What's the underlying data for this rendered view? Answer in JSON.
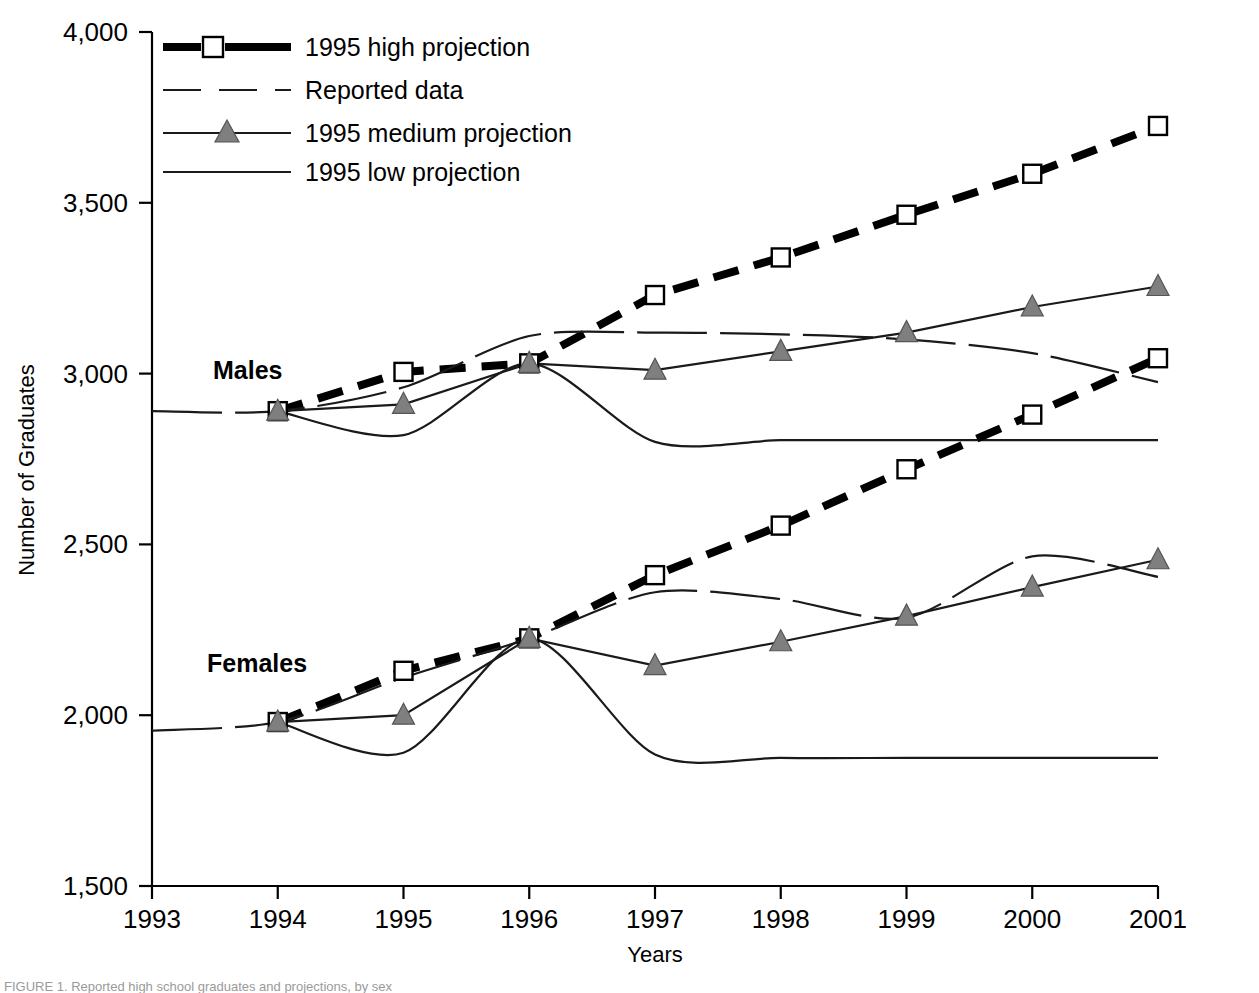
{
  "figure": {
    "caption_fragment": "FIGURE 1. Reported high school graduates and projections, by sex"
  },
  "axes": {
    "y_title": "Number of Graduates",
    "x_title": "Years",
    "y_ticks": [
      "4,000",
      "3,500",
      "3,000",
      "2,500",
      "2,000",
      "1,500"
    ],
    "x_ticks": [
      "1993",
      "1994",
      "1995",
      "1996",
      "1997",
      "1998",
      "1999",
      "2000",
      "2001"
    ]
  },
  "legend": {
    "items": [
      {
        "label": "1995 high projection",
        "marker": "square-icon",
        "style": "thick-dashed"
      },
      {
        "label": "Reported data",
        "marker": "none",
        "style": "thin-dashed"
      },
      {
        "label": "1995 medium projection",
        "marker": "triangle-icon",
        "style": "thin-solid"
      },
      {
        "label": "1995 low projection",
        "marker": "none",
        "style": "thin-solid"
      }
    ]
  },
  "group_labels": {
    "males": "Males",
    "females": "Females"
  },
  "colors": {
    "line": "#1a1a1a",
    "high_projection": "#000000",
    "marker_triangle_fill": "#7f7f7f",
    "marker_square_fill": "#ffffff",
    "background": "#ffffff"
  },
  "chart_data": {
    "type": "line",
    "title": "",
    "xlabel": "Years",
    "ylabel": "Number of Graduates",
    "xlim": [
      1993,
      2001
    ],
    "ylim": [
      1500,
      4000
    ],
    "ytick_step": 500,
    "grid": false,
    "legend_position": "top-left",
    "x": [
      1993,
      1994,
      1995,
      1996,
      1997,
      1998,
      1999,
      2000,
      2001
    ],
    "groups": [
      {
        "name": "Males",
        "series": [
          {
            "name": "1995 high projection",
            "marker": "square",
            "x": [
              1994,
              1995,
              1996,
              1997,
              1998,
              1999,
              2000,
              2001
            ],
            "values": [
              2890,
              3005,
              3030,
              3230,
              3340,
              3465,
              3585,
              3725
            ]
          },
          {
            "name": "1995 medium projection",
            "marker": "triangle",
            "x": [
              1994,
              1995,
              1996,
              1997,
              1998,
              1999,
              2000,
              2001
            ],
            "values": [
              2890,
              2910,
              3030,
              3010,
              3065,
              3120,
              3195,
              3255
            ]
          },
          {
            "name": "1995 low projection",
            "marker": "none",
            "x": [
              1994,
              1995,
              1996,
              1997,
              1998,
              1999,
              2000,
              2001
            ],
            "values": [
              2890,
              2820,
              3030,
              2800,
              2805,
              2805,
              2805,
              2805
            ]
          },
          {
            "name": "Reported data",
            "marker": "none",
            "x": [
              1993,
              1994,
              1995,
              1996,
              1997,
              1998,
              1999,
              2000,
              2001
            ],
            "values": [
              2890,
              2890,
              2960,
              3110,
              3120,
              3115,
              3100,
              3060,
              2975
            ]
          }
        ]
      },
      {
        "name": "Females",
        "series": [
          {
            "name": "1995 high projection",
            "marker": "square",
            "x": [
              1994,
              1995,
              1996,
              1997,
              1998,
              1999,
              2000,
              2001
            ],
            "values": [
              1980,
              2130,
              2225,
              2410,
              2555,
              2720,
              2880,
              3045
            ]
          },
          {
            "name": "1995 medium projection",
            "marker": "triangle",
            "x": [
              1994,
              1995,
              1996,
              1997,
              1998,
              1999,
              2000,
              2001
            ],
            "values": [
              1980,
              2000,
              2225,
              2145,
              2215,
              2290,
              2375,
              2455
            ]
          },
          {
            "name": "1995 low projection",
            "marker": "none",
            "x": [
              1994,
              1995,
              1996,
              1997,
              1998,
              1999,
              2000,
              2001
            ],
            "values": [
              1980,
              1890,
              2225,
              1885,
              1875,
              1875,
              1875,
              1875
            ]
          },
          {
            "name": "Reported data",
            "marker": "none",
            "x": [
              1993,
              1994,
              1995,
              1996,
              1997,
              1998,
              1999,
              2000,
              2001
            ],
            "values": [
              1955,
              1980,
              2110,
              2225,
              2360,
              2340,
              2285,
              2465,
              2405
            ]
          }
        ]
      }
    ]
  }
}
